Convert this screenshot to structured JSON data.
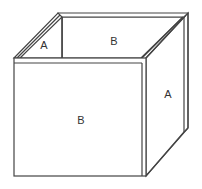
{
  "diagram": {
    "type": "open-box-3d",
    "stroke_color": "#444444",
    "fill_color": "#ffffff",
    "labels": {
      "back_left_inner": "A",
      "back_inner": "B",
      "front": "B",
      "right_side": "A"
    }
  }
}
